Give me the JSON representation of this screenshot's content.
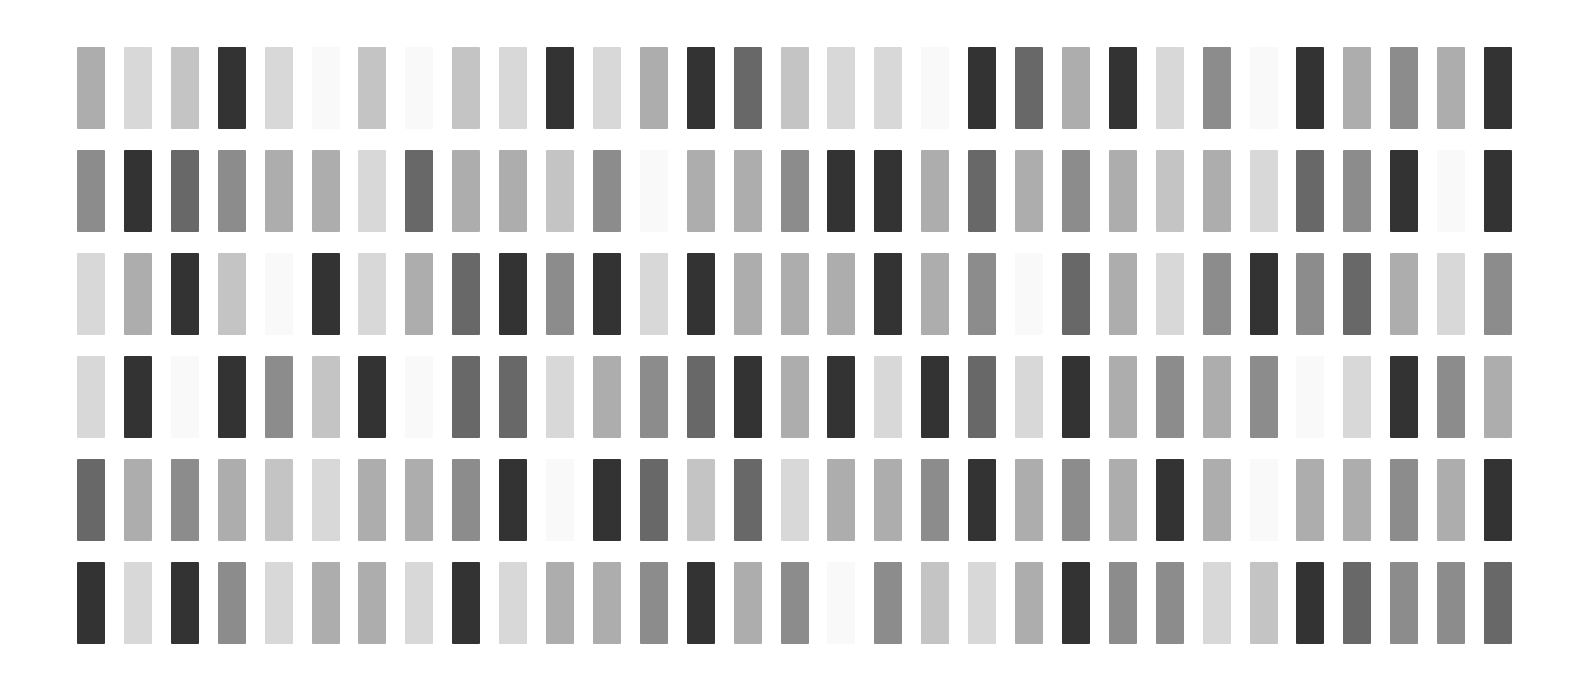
{
  "grid": {
    "rows": 6,
    "columns": 31,
    "origin_x": 77,
    "origin_y": 47,
    "pitch_x": 46.9,
    "pitch_y": 102.9,
    "cell_width": 28,
    "cell_height": 82,
    "background": "#ffffff"
  },
  "palette": {
    "W": "#f9f9f9",
    "L1": "#d8d8d8",
    "L2": "#c4c4c4",
    "M1": "#adadad",
    "M2": "#8c8c8c",
    "D1": "#686868",
    "D2": "#333333"
  },
  "cells": [
    [
      "M1",
      "L1",
      "L2",
      "D2",
      "L1",
      "W",
      "L2",
      "W",
      "L2",
      "L1",
      "D2",
      "L1",
      "M1",
      "D2",
      "D1",
      "L2",
      "L1",
      "L1",
      "W",
      "D2",
      "D1",
      "M1",
      "D2",
      "L1",
      "M2",
      "W",
      "D2",
      "M1",
      "M2",
      "M1",
      "D2"
    ],
    [
      "M2",
      "D2",
      "D1",
      "M2",
      "M1",
      "M1",
      "L1",
      "D1",
      "M1",
      "M1",
      "L2",
      "M2",
      "W",
      "M1",
      "M1",
      "M2",
      "D2",
      "D2",
      "M1",
      "D1",
      "M1",
      "M2",
      "M1",
      "L2",
      "M1",
      "L1",
      "D1",
      "M2",
      "D2",
      "W",
      "D2"
    ],
    [
      "L1",
      "M1",
      "D2",
      "L2",
      "W",
      "D2",
      "L1",
      "M1",
      "D1",
      "D2",
      "M2",
      "D2",
      "L1",
      "D2",
      "M1",
      "M1",
      "M1",
      "D2",
      "M1",
      "M2",
      "W",
      "D1",
      "M1",
      "L1",
      "M2",
      "D2",
      "M2",
      "D1",
      "M1",
      "L1",
      "M2"
    ],
    [
      "L1",
      "D2",
      "W",
      "D2",
      "M2",
      "L2",
      "D2",
      "W",
      "D1",
      "D1",
      "L1",
      "M1",
      "M2",
      "D1",
      "D2",
      "M1",
      "D2",
      "L1",
      "D2",
      "D1",
      "L1",
      "D2",
      "M1",
      "M2",
      "M1",
      "M2",
      "W",
      "L1",
      "D2",
      "M2",
      "M1"
    ],
    [
      "D1",
      "M1",
      "M2",
      "M1",
      "L2",
      "L1",
      "M1",
      "M1",
      "M2",
      "D2",
      "W",
      "D2",
      "D1",
      "L2",
      "D1",
      "L1",
      "M1",
      "M1",
      "M2",
      "D2",
      "M1",
      "M2",
      "M1",
      "D2",
      "M1",
      "W",
      "M1",
      "M1",
      "M2",
      "M1",
      "D2"
    ],
    [
      "D2",
      "L1",
      "D2",
      "M2",
      "L1",
      "M1",
      "M1",
      "L1",
      "D2",
      "L1",
      "M1",
      "M1",
      "M2",
      "D2",
      "M1",
      "M2",
      "W",
      "M2",
      "L2",
      "L1",
      "M1",
      "D2",
      "M2",
      "M2",
      "L1",
      "L2",
      "D2",
      "D1",
      "M2",
      "M2",
      "D1"
    ]
  ]
}
